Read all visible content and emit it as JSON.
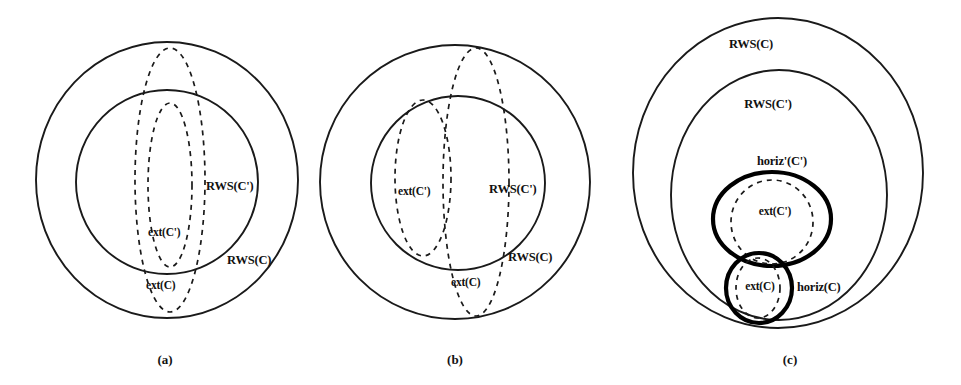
{
  "figure": {
    "title": "",
    "background_color": "#ffffff",
    "ink_color": "#111111",
    "panels": [
      {
        "id": "a",
        "caption": "(a)",
        "caption_pos": {
          "x": 165,
          "y": 364
        },
        "shapes": [
          {
            "name": "rws-c-outer-circle",
            "style": "solid-thin",
            "type": "ellipse",
            "cx": 167,
            "cy": 180,
            "rx": 131,
            "ry": 138
          },
          {
            "name": "rws-cprime-inner-circle",
            "style": "solid-thin",
            "type": "ellipse",
            "cx": 167,
            "cy": 182,
            "rx": 91,
            "ry": 92
          },
          {
            "name": "ext-c-dashed-ellipse",
            "style": "dashed",
            "type": "ellipse",
            "cx": 170,
            "cy": 180,
            "rx": 35,
            "ry": 132
          },
          {
            "name": "ext-cprime-dashed-ellipse",
            "style": "dashed",
            "type": "ellipse",
            "cx": 170,
            "cy": 185,
            "rx": 22,
            "ry": 82
          }
        ],
        "labels": [
          {
            "name": "label-rws-cprime",
            "text": "RWS(C')",
            "x": 206,
            "y": 190
          },
          {
            "name": "label-ext-cprime",
            "text": "ext(C')",
            "x": 148,
            "y": 236
          },
          {
            "name": "label-rws-c",
            "text": "RWS(C)",
            "x": 227,
            "y": 264
          },
          {
            "name": "label-ext-c",
            "text": "ext(C)",
            "x": 146,
            "y": 289
          }
        ]
      },
      {
        "id": "b",
        "caption": "(b)",
        "caption_pos": {
          "x": 455,
          "y": 364
        },
        "shapes": [
          {
            "name": "rws-c-outer-circle",
            "style": "solid-thin",
            "type": "ellipse",
            "cx": 455,
            "cy": 182,
            "rx": 135,
            "ry": 137
          },
          {
            "name": "rws-cprime-inner-circle",
            "style": "solid-thin",
            "type": "ellipse",
            "cx": 458,
            "cy": 183,
            "rx": 87,
            "ry": 87
          },
          {
            "name": "ext-cprime-dashed-ellipse",
            "style": "dashed",
            "type": "ellipse",
            "cx": 423,
            "cy": 178,
            "rx": 28,
            "ry": 78
          },
          {
            "name": "ext-c-dashed-ellipse",
            "style": "dashed",
            "type": "ellipse",
            "cx": 476,
            "cy": 182,
            "rx": 33,
            "ry": 134
          }
        ],
        "labels": [
          {
            "name": "label-ext-cprime",
            "text": "ext(C')",
            "x": 398,
            "y": 195
          },
          {
            "name": "label-rws-cprime",
            "text": "RWS(C')",
            "x": 489,
            "y": 193
          },
          {
            "name": "label-rws-c",
            "text": "RWS(C)",
            "x": 508,
            "y": 261
          },
          {
            "name": "label-ext-c",
            "text": "ext(C)",
            "x": 451,
            "y": 286
          }
        ]
      },
      {
        "id": "c",
        "caption": "(c)",
        "caption_pos": {
          "x": 790,
          "y": 364
        },
        "shapes": [
          {
            "name": "rws-c-outer-circle",
            "style": "solid-thin",
            "type": "ellipse",
            "cx": 778,
            "cy": 173,
            "rx": 145,
            "ry": 155
          },
          {
            "name": "rws-cprime-inner-circle",
            "style": "solid-thin",
            "type": "ellipse",
            "cx": 779,
            "cy": 195,
            "rx": 108,
            "ry": 125
          },
          {
            "name": "horiz-cprime-bold-circle",
            "style": "solid-bold",
            "type": "ellipse",
            "cx": 772,
            "cy": 219,
            "rx": 59,
            "ry": 47
          },
          {
            "name": "horiz-c-bold-circle",
            "style": "solid-bold",
            "type": "ellipse",
            "cx": 759,
            "cy": 288,
            "rx": 33,
            "ry": 35
          },
          {
            "name": "ext-cprime-dashed-ellipse",
            "style": "dashed",
            "type": "ellipse",
            "cx": 772,
            "cy": 222,
            "rx": 41,
            "ry": 42
          },
          {
            "name": "ext-c-dashed-ellipse",
            "style": "dashed",
            "type": "ellipse",
            "cx": 758,
            "cy": 288,
            "rx": 22,
            "ry": 30
          }
        ],
        "labels": [
          {
            "name": "label-rws-c",
            "text": "RWS(C)",
            "x": 751,
            "y": 48
          },
          {
            "name": "label-rws-cprime",
            "text": "RWS(C')",
            "x": 768,
            "y": 108
          },
          {
            "name": "label-horiz-cprime",
            "text": "horiz'(C')",
            "x": 782,
            "y": 165
          },
          {
            "name": "label-ext-cprime",
            "text": "ext(C')",
            "x": 775,
            "y": 215
          },
          {
            "name": "label-ext-c",
            "text": "ext(C)",
            "x": 760,
            "y": 290
          },
          {
            "name": "label-horiz-c",
            "text": "horiz(C)",
            "x": 797,
            "y": 291
          }
        ]
      }
    ]
  }
}
